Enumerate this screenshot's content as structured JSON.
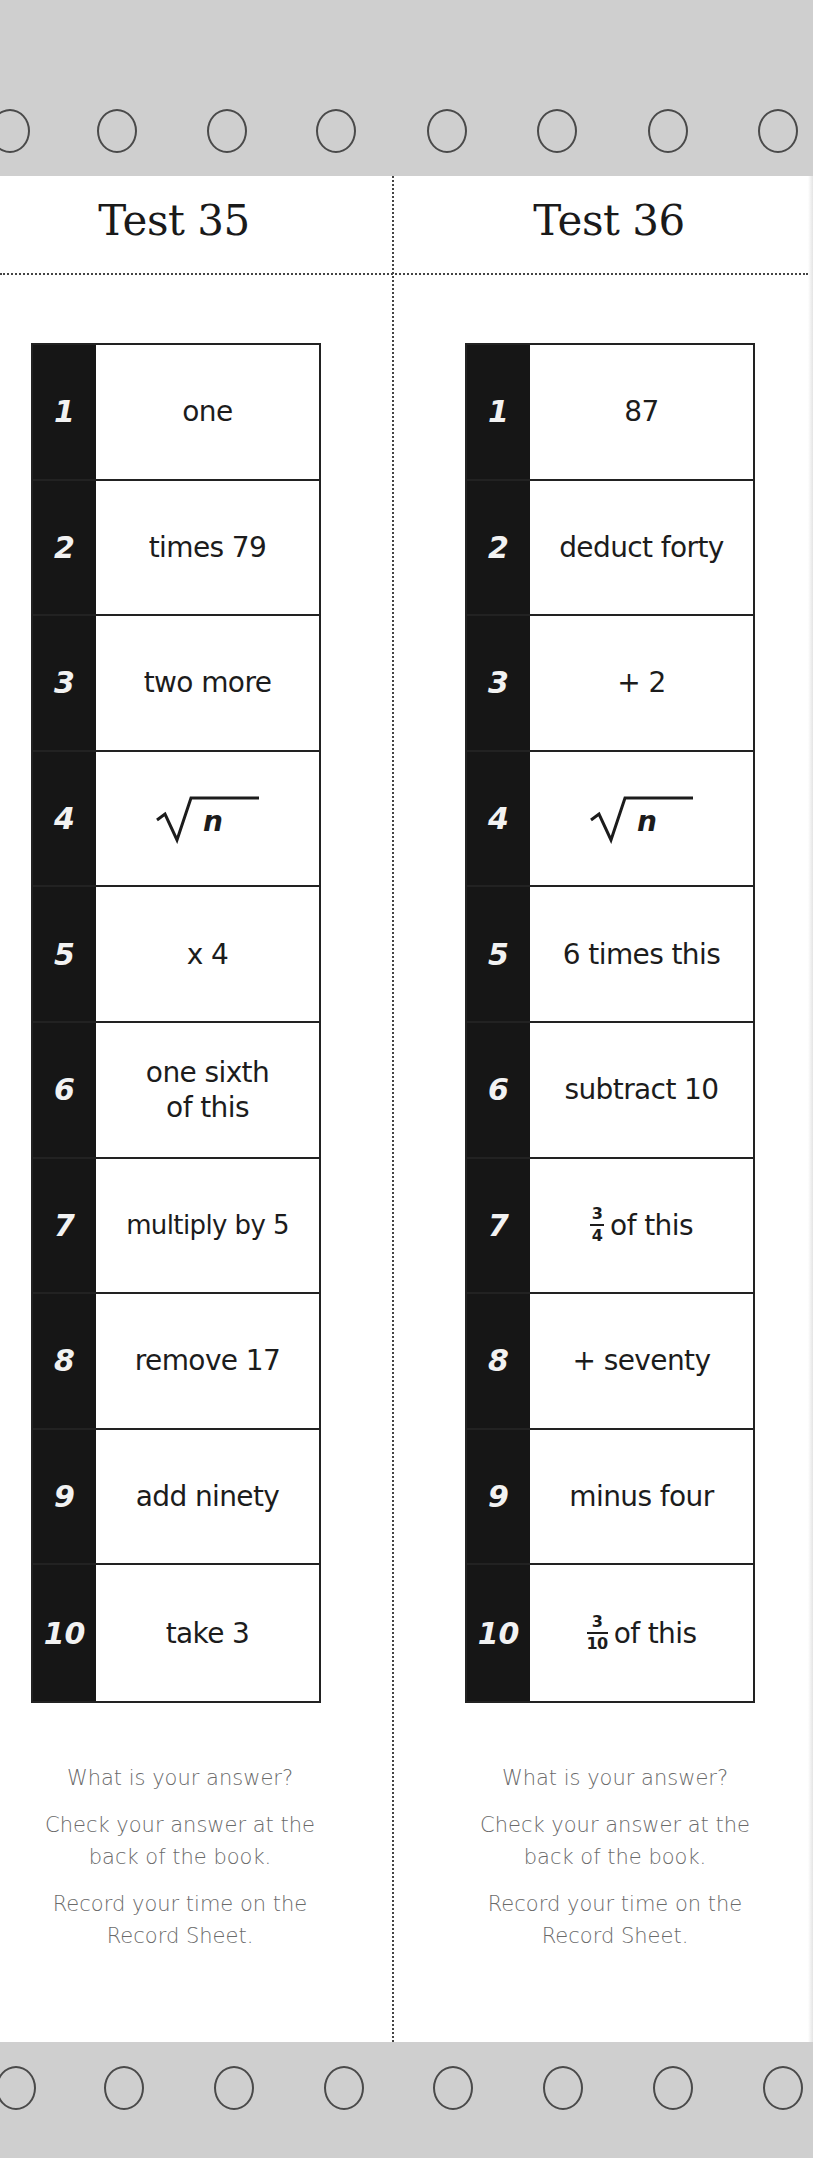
{
  "page": {
    "background": "#ffffff",
    "band_color": "#cfcfcf",
    "number_strip_color": "#161616",
    "note_color": "#6a6a6a"
  },
  "binder_holes": {
    "top_count": 8,
    "bottom_count": 8
  },
  "tests": [
    {
      "title": "Test 35",
      "steps": [
        {
          "number": "1",
          "text": "one"
        },
        {
          "number": "2",
          "text": "times 79"
        },
        {
          "number": "3",
          "text": "two more"
        },
        {
          "number": "4",
          "text": "n",
          "symbol": "square-root"
        },
        {
          "number": "5",
          "text": "x 4"
        },
        {
          "number": "6",
          "text": "one sixth\nof this"
        },
        {
          "number": "7",
          "text": "multiply by 5"
        },
        {
          "number": "8",
          "text": "remove 17"
        },
        {
          "number": "9",
          "text": "add ninety"
        },
        {
          "number": "10",
          "text": "take 3"
        }
      ],
      "notes": {
        "question": "What is your answer?",
        "check": "Check your answer at the\nback of the book.",
        "record": "Record your time on the\nRecord Sheet."
      }
    },
    {
      "title": "Test 36",
      "steps": [
        {
          "number": "1",
          "text": "87"
        },
        {
          "number": "2",
          "text": "deduct forty"
        },
        {
          "number": "3",
          "text": "+ 2"
        },
        {
          "number": "4",
          "text": "n",
          "symbol": "square-root"
        },
        {
          "number": "5",
          "text": "6 times this"
        },
        {
          "number": "6",
          "text": "subtract 10"
        },
        {
          "number": "7",
          "text": "of this",
          "fraction": {
            "numerator": "3",
            "denominator": "4"
          }
        },
        {
          "number": "8",
          "text": "+ seventy"
        },
        {
          "number": "9",
          "text": "minus four"
        },
        {
          "number": "10",
          "text": "of this",
          "fraction": {
            "numerator": "3",
            "denominator": "10"
          }
        }
      ],
      "notes": {
        "question": "What is your answer?",
        "check": "Check your answer at the\nback of the book.",
        "record": "Record your time on the\nRecord Sheet."
      }
    }
  ]
}
